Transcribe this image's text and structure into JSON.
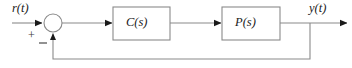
{
  "diagram": {
    "type": "block-diagram",
    "signals": {
      "input": "r(t)",
      "output": "y(t)"
    },
    "summing_junction": {
      "name": "summing-junction",
      "cx": 53,
      "cy": 23,
      "r": 9,
      "plus_sign": "+",
      "minus_sign": "−",
      "plus_input": "r(t)",
      "minus_input": "feedback"
    },
    "blocks": [
      {
        "id": "controller",
        "label": "C(s)",
        "x": 113,
        "y": 7,
        "width": 57,
        "height": 33
      },
      {
        "id": "plant",
        "label": "P(s)",
        "x": 222,
        "y": 7,
        "width": 58,
        "height": 33
      }
    ],
    "connections": [
      {
        "id": "input-to-sum",
        "from": "r(t)",
        "to": "summing-junction",
        "arrow": true
      },
      {
        "id": "sum-to-controller",
        "from": "summing-junction",
        "to": "C(s)",
        "arrow": true
      },
      {
        "id": "controller-to-plant",
        "from": "C(s)",
        "to": "P(s)",
        "arrow": true
      },
      {
        "id": "plant-to-output",
        "from": "P(s)",
        "to": "y(t)",
        "arrow": true
      },
      {
        "id": "feedback-path",
        "from": "y(t)",
        "to": "summing-junction",
        "arrow": true
      }
    ],
    "colors": {
      "line": "#8a8a8a",
      "block_border": "#8a8a8a",
      "text": "#1a1a1a",
      "background": "#ffffff",
      "arrow_fill": "#1a1a1a"
    },
    "geometry": {
      "main_line_y": 23,
      "feedback_line_y": 59,
      "feedback_tap_x": 310,
      "output_arrow_tip_x": 348,
      "input_line_start_x": 12
    }
  }
}
